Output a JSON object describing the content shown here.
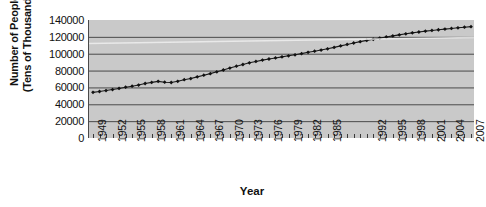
{
  "chart_data": {
    "type": "line",
    "title": "",
    "xlabel": "Year",
    "ylabel": "Number of People (Tens of Thousands)",
    "ylabel_lines": [
      "Number of People",
      "(Tens of Thousands)"
    ],
    "ylim": [
      0,
      140000
    ],
    "yticks": [
      0,
      20000,
      40000,
      60000,
      80000,
      100000,
      120000,
      140000
    ],
    "ytick_labels": [
      "0",
      "20000",
      "40000",
      "60000",
      "80000",
      "100000",
      "120000",
      "140000"
    ],
    "xlim": [
      1949,
      2007
    ],
    "grid": true,
    "grid_axis": "y",
    "legend": false,
    "marker": "diamond",
    "line_color": "#1a1a1a",
    "plot_background": "#c9c9c9",
    "grid_color": "#4a4a4a",
    "x": [
      1949,
      1950,
      1951,
      1952,
      1953,
      1954,
      1955,
      1956,
      1957,
      1958,
      1959,
      1960,
      1961,
      1962,
      1963,
      1964,
      1965,
      1966,
      1967,
      1968,
      1969,
      1970,
      1971,
      1972,
      1973,
      1974,
      1975,
      1976,
      1977,
      1978,
      1979,
      1980,
      1981,
      1982,
      1983,
      1984,
      1985,
      1986,
      1987,
      1988,
      1989,
      1990,
      1991,
      1992,
      1993,
      1994,
      1995,
      1996,
      1997,
      1998,
      1999,
      2000,
      2001,
      2002,
      2003,
      2004,
      2005,
      2006,
      2007
    ],
    "xtick_labels": [
      "1949",
      "1952",
      "1955",
      "1958",
      "1961",
      "1964",
      "1967",
      "1970",
      "1973",
      "1976",
      "1979",
      "1982",
      "1985",
      "1992",
      "1995",
      "1998",
      "2001",
      "2004",
      "2007"
    ],
    "xtick_years": [
      1949,
      1952,
      1955,
      1958,
      1961,
      1964,
      1967,
      1970,
      1973,
      1976,
      1979,
      1982,
      1985,
      1992,
      1995,
      1998,
      2001,
      2004,
      2007
    ],
    "values": [
      54167,
      55196,
      56300,
      57482,
      58796,
      60266,
      61465,
      62828,
      64653,
      65994,
      67207,
      66207,
      65859,
      67295,
      69172,
      70499,
      72538,
      74542,
      76368,
      78534,
      80671,
      82992,
      85229,
      87177,
      89211,
      90859,
      92420,
      93717,
      94974,
      96259,
      97542,
      98705,
      100072,
      101654,
      103008,
      104357,
      105851,
      107507,
      109300,
      111026,
      112704,
      114333,
      115823,
      117171,
      118517,
      119850,
      121121,
      122389,
      123626,
      124761,
      125786,
      126743,
      127627,
      128453,
      129227,
      129988,
      130756,
      131448,
      132129
    ],
    "series_name": "Population"
  }
}
